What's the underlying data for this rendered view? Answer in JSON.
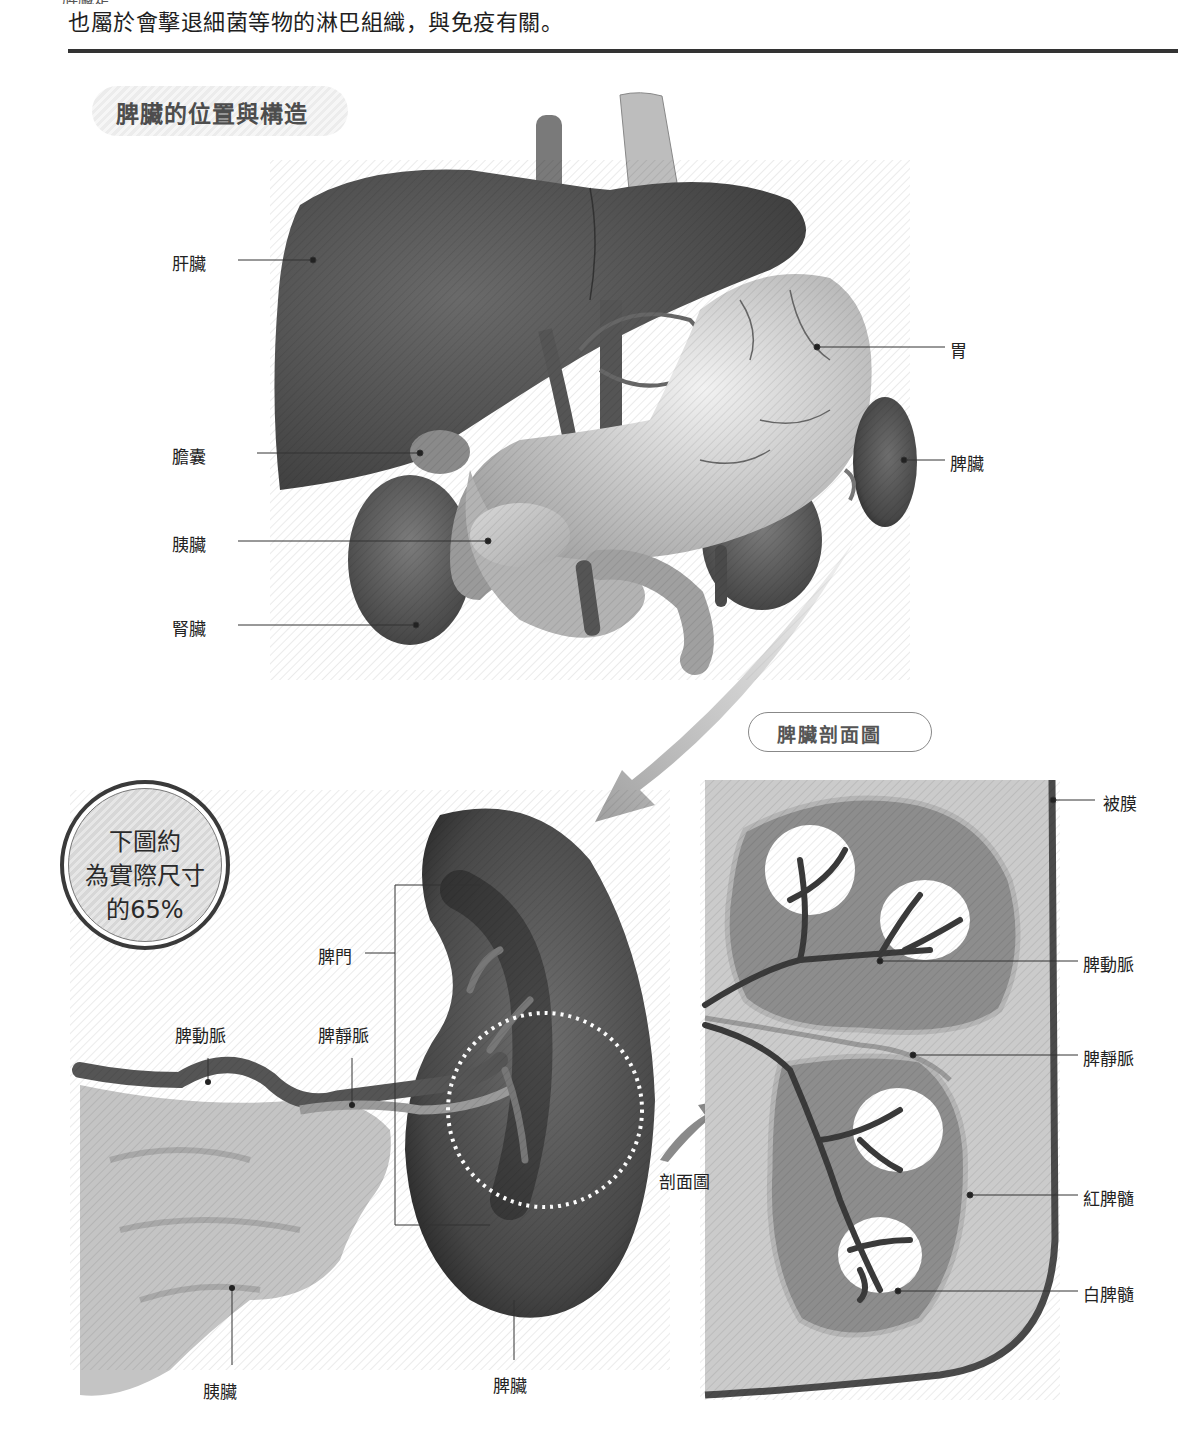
{
  "page": {
    "cut_off_top_text": "脾臟是",
    "intro_text": "也屬於會擊退細菌等物的淋巴組織，與免疫有關。"
  },
  "section": {
    "title": "脾臟的位置與構造"
  },
  "upper_figure": {
    "labels": {
      "liver": "肝臟",
      "gallbladder": "膽囊",
      "pancreas": "胰臟",
      "kidney": "腎臟",
      "stomach": "胃",
      "spleen": "脾臟"
    }
  },
  "scale_badge": {
    "line1": "下圖約",
    "line2": "為實際尺寸",
    "line3": "的65%"
  },
  "lower_figure": {
    "labels": {
      "hilum": "脾門",
      "splenic_artery": "脾動脈",
      "splenic_vein": "脾靜脈",
      "pancreas": "胰臟",
      "spleen": "脾臟",
      "cross_section_arrow": "剖面圖"
    }
  },
  "cross_section": {
    "title": "脾臟剖面圖",
    "labels": {
      "capsule": "被膜",
      "splenic_artery": "脾動脈",
      "splenic_vein": "脾靜脈",
      "red_pulp": "紅脾髓",
      "white_pulp": "白脾髓"
    }
  },
  "colors": {
    "organ_dark": "#4a4a4a",
    "organ_mid": "#8a8a8a",
    "organ_light": "#cfcfcf",
    "rule": "#333333",
    "pill_bg": "#efefef",
    "red_pulp": "#8c8c8c",
    "section_bg": "#c8c8c8"
  }
}
